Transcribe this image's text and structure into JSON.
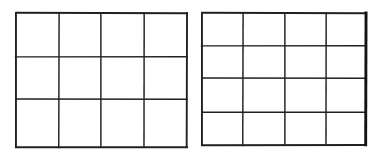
{
  "figure": {
    "background_color": "#ffffff",
    "line_color": "#23211f",
    "width": 374,
    "height": 156
  },
  "diagram_data": {
    "type": "diagram",
    "description": "Two side-by-side hand-drawn rectangular grids of equal width; the left grid has 3 rows and the right grid has 4 rows.",
    "panel_count": 2,
    "panels": [
      {
        "name": "left-grid",
        "label": "Left grid",
        "columns": 4,
        "rows": 3,
        "cell_count": 12,
        "x": 14,
        "y": 11,
        "width": 171,
        "height": 134,
        "column_lines_x": [
          14,
          57,
          99,
          142,
          185
        ],
        "row_lines_y": [
          11,
          55,
          97,
          145
        ],
        "heavy_right_border": false
      },
      {
        "name": "right-grid",
        "label": "Right grid",
        "columns": 4,
        "rows": 4,
        "cell_count": 16,
        "x": 200,
        "y": 11,
        "width": 164,
        "height": 132,
        "column_lines_x": [
          200,
          241,
          283,
          324,
          364
        ],
        "row_lines_y": [
          11,
          44,
          76,
          110,
          143
        ],
        "heavy_right_border": true
      }
    ],
    "gap_between_panels_px": 15
  }
}
